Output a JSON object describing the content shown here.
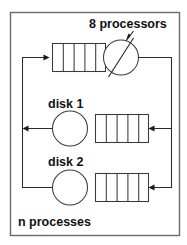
{
  "figure": {
    "background_color": "#ffffff",
    "frame_color": "#6b6b6b",
    "line_color": "#2b2b2b"
  },
  "labels": {
    "processors": "8 processors",
    "disk1": "disk 1",
    "disk2": "disk 2",
    "processes": "n processes"
  },
  "stations": [
    {
      "id": "cpu",
      "label": "8 processors",
      "server_type": "multi-server",
      "server_count": 8,
      "queue_slots": 5,
      "queue_side": "left",
      "row": "top"
    },
    {
      "id": "disk1",
      "label": "disk 1",
      "server_type": "single-server",
      "server_count": 1,
      "queue_slots": 5,
      "queue_side": "right",
      "row": "middle"
    },
    {
      "id": "disk2",
      "label": "disk 2",
      "server_type": "single-server",
      "server_count": 1,
      "queue_slots": 5,
      "queue_side": "right",
      "row": "bottom"
    }
  ],
  "population": {
    "label": "n processes",
    "symbol": "n"
  },
  "routing": [
    {
      "from": "cpu",
      "to": "disk1",
      "path": "right-bus"
    },
    {
      "from": "cpu",
      "to": "disk2",
      "path": "right-bus"
    },
    {
      "from": "disk1",
      "to": "cpu",
      "path": "left-bus"
    },
    {
      "from": "disk2",
      "to": "cpu",
      "path": "left-bus"
    }
  ]
}
